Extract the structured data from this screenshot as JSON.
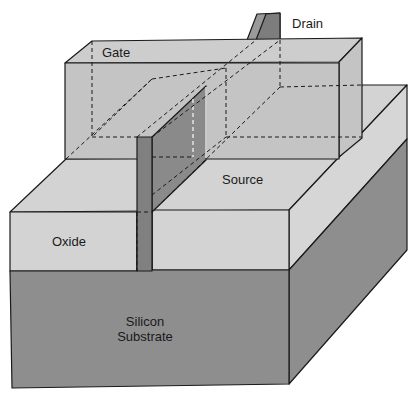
{
  "diagram": {
    "type": "finfet-3d-cross-section",
    "labels": {
      "drain": "Drain",
      "gate": "Gate",
      "source": "Source",
      "oxide": "Oxide",
      "substrate_line1": "Silicon",
      "substrate_line2": "Substrate"
    },
    "colors": {
      "light_face": "#d3d3d3",
      "gate_face": "#c4c4c4",
      "gate_top": "#cdcdcd",
      "dark_face": "#8e8e8e",
      "fin": "#808080",
      "fin_side": "#979797",
      "outline": "#1a1a1a"
    }
  }
}
